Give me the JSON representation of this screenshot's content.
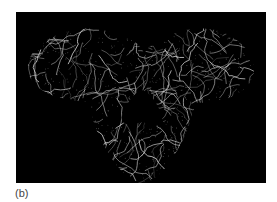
{
  "figure": {
    "panel_label": "(b)",
    "colors": {
      "background": "#000000",
      "wire": "#d8d8d8",
      "page": "#ffffff",
      "caption": "#444444"
    }
  }
}
